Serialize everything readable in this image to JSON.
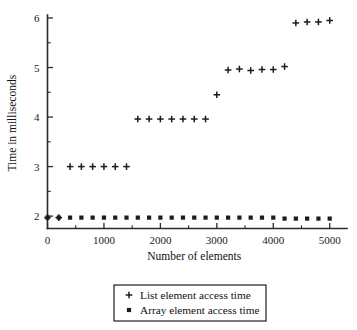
{
  "chart_data": {
    "type": "scatter",
    "title": "",
    "xlabel": "Number of elements",
    "ylabel": "Time in milliseconds",
    "xlim": [
      0,
      5200
    ],
    "ylim": [
      1.75,
      6.0
    ],
    "grid": false,
    "legend_position": "below-axes",
    "x_ticks": [
      0,
      1000,
      2000,
      3000,
      4000,
      5000
    ],
    "x_tick_labels": [
      "0",
      "1000",
      "2000",
      "3000",
      "4000",
      "5000"
    ],
    "x_minor_ticks": [
      500,
      1500,
      2500,
      3500,
      4500
    ],
    "y_ticks": [
      2,
      3,
      4,
      5,
      6
    ],
    "y_tick_labels": [
      "2",
      "3",
      "4",
      "5",
      "6"
    ],
    "y_minor_ticks": [
      2.5,
      3.5,
      4.5,
      5.5
    ],
    "series": [
      {
        "name": "List element access time",
        "marker": "plus",
        "color": "#1c1c1c",
        "points": [
          [
            0,
            1.97
          ],
          [
            200,
            1.97
          ],
          [
            400,
            3.0
          ],
          [
            600,
            3.0
          ],
          [
            800,
            3.0
          ],
          [
            1000,
            3.0
          ],
          [
            1200,
            3.0
          ],
          [
            1400,
            3.0
          ],
          [
            1600,
            3.96
          ],
          [
            1800,
            3.96
          ],
          [
            2000,
            3.96
          ],
          [
            2200,
            3.96
          ],
          [
            2400,
            3.96
          ],
          [
            2600,
            3.96
          ],
          [
            2800,
            3.96
          ],
          [
            3000,
            4.45
          ],
          [
            3200,
            4.95
          ],
          [
            3400,
            4.97
          ],
          [
            3600,
            4.94
          ],
          [
            3800,
            4.96
          ],
          [
            4000,
            4.96
          ],
          [
            4200,
            5.02
          ],
          [
            4400,
            5.9
          ],
          [
            4600,
            5.92
          ],
          [
            4800,
            5.92
          ],
          [
            5000,
            5.95
          ]
        ]
      },
      {
        "name": "Array element access time",
        "marker": "square",
        "color": "#1c1c1c",
        "points": [
          [
            0,
            1.97
          ],
          [
            200,
            1.97
          ],
          [
            400,
            1.97
          ],
          [
            600,
            1.97
          ],
          [
            800,
            1.97
          ],
          [
            1000,
            1.97
          ],
          [
            1200,
            1.97
          ],
          [
            1400,
            1.97
          ],
          [
            1600,
            1.97
          ],
          [
            1800,
            1.97
          ],
          [
            2000,
            1.97
          ],
          [
            2200,
            1.97
          ],
          [
            2400,
            1.97
          ],
          [
            2600,
            1.97
          ],
          [
            2800,
            1.97
          ],
          [
            3000,
            1.97
          ],
          [
            3200,
            1.97
          ],
          [
            3400,
            1.97
          ],
          [
            3600,
            1.97
          ],
          [
            3800,
            1.97
          ],
          [
            4000,
            1.97
          ],
          [
            4200,
            1.95
          ],
          [
            4400,
            1.95
          ],
          [
            4600,
            1.95
          ],
          [
            4800,
            1.95
          ],
          [
            5000,
            1.95
          ]
        ]
      }
    ],
    "legend": [
      {
        "label": "List element access time",
        "marker": "plus"
      },
      {
        "label": "Array element access time",
        "marker": "square"
      }
    ]
  }
}
